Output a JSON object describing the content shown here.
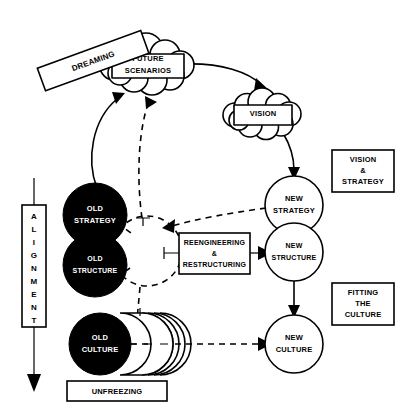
{
  "diagram": {
    "colors": {
      "ink": "#000000",
      "paper": "#ffffff",
      "old_state_fill": "#000000",
      "new_state_fill": "#ffffff"
    },
    "clouds": [
      {
        "id": "future-scenarios",
        "line1": "FUTURE",
        "line2": "SCENARIOS"
      },
      {
        "id": "vision",
        "line1": "VISION",
        "line2": ""
      }
    ],
    "old_nodes": [
      {
        "id": "old-strategy",
        "line1": "OLD",
        "line2": "STRATEGY"
      },
      {
        "id": "old-structure",
        "line1": "OLD",
        "line2": "STRUCTURE"
      },
      {
        "id": "old-culture",
        "line1": "OLD",
        "line2": "CULTURE"
      }
    ],
    "new_nodes": [
      {
        "id": "new-strategy",
        "line1": "NEW",
        "line2": "STRATEGY"
      },
      {
        "id": "new-structure",
        "line1": "NEW",
        "line2": "STRUCTURE"
      },
      {
        "id": "new-culture",
        "line1": "NEW",
        "line2": "CULTURE"
      }
    ],
    "process_box": {
      "id": "reengineering-restructuring",
      "line1": "REENGINEERING",
      "line2": "&",
      "line3": "RESTRUCTURING"
    },
    "callout_boxes": [
      {
        "id": "vision-and-strategy",
        "line1": "VISION",
        "line2": "&",
        "line3": "STRATEGY"
      },
      {
        "id": "fitting-the-culture",
        "line1": "FITTING",
        "line2": "THE",
        "line3": "CULTURE"
      }
    ],
    "rotated_label": {
      "id": "dreaming",
      "text": "DREAMING"
    },
    "bottom_label": {
      "id": "unfreezing",
      "text": "UNFREEZING"
    },
    "vertical_label": {
      "id": "alignment",
      "text": "ALIGNMENT",
      "letters": [
        "A",
        "L",
        "I",
        "G",
        "N",
        "M",
        "E",
        "N",
        "T"
      ]
    }
  }
}
